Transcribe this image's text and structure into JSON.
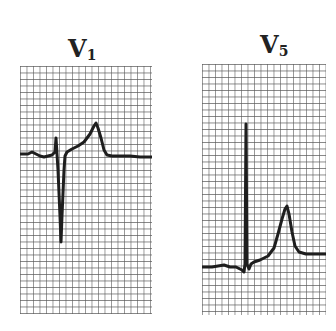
{
  "figure": {
    "leads": [
      {
        "name": "V",
        "subscript": "1",
        "label": "V1",
        "description": "rS complex with deep S wave, ST segment elevated with peaked T wave"
      },
      {
        "name": "V",
        "subscript": "5",
        "label": "V5",
        "description": "Small complex with tall peaked T wave"
      }
    ],
    "colors": {
      "background": "#ffffff",
      "grid": "#5a5a5a",
      "trace": "#1e1e1e"
    }
  }
}
